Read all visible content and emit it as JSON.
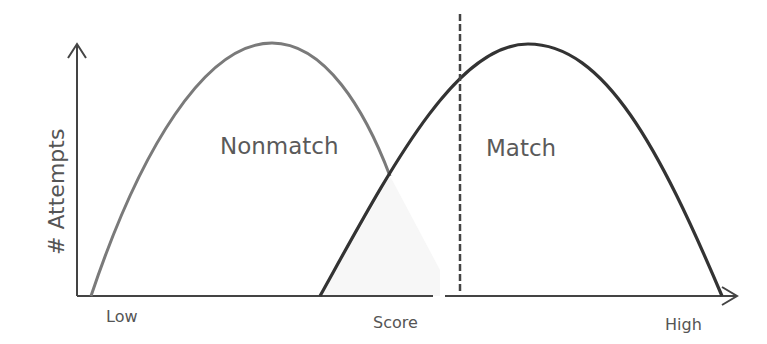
{
  "diagram": {
    "type": "score-distribution",
    "y_axis_label": "# Attempts",
    "x_axis_label": "Score",
    "x_low_label": "Low",
    "x_high_label": "High",
    "curves": [
      {
        "name": "Nonmatch",
        "label": "Nonmatch",
        "color": "#7a7a7a"
      },
      {
        "name": "Match",
        "label": "Match",
        "color": "#333333"
      }
    ],
    "threshold": {
      "style": "dashed",
      "color": "#444444"
    }
  }
}
